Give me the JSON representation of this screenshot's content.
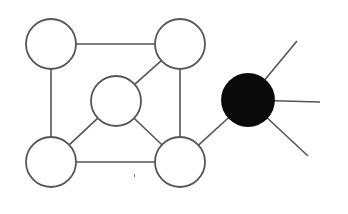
{
  "diagram": {
    "type": "graph",
    "background": "#ffffff",
    "stroke_color": "#555555",
    "node_fill": "#ffffff",
    "highlight_fill": "#0a0a0a",
    "nodes": [
      {
        "id": "n-top-left",
        "cx": 51,
        "cy": 44,
        "r": 25,
        "filled": false
      },
      {
        "id": "n-top-right",
        "cx": 180,
        "cy": 44,
        "r": 25,
        "filled": false
      },
      {
        "id": "n-center",
        "cx": 116,
        "cy": 101,
        "r": 25,
        "filled": false
      },
      {
        "id": "n-bottom-left",
        "cx": 51,
        "cy": 162,
        "r": 25,
        "filled": false
      },
      {
        "id": "n-bottom-right",
        "cx": 180,
        "cy": 162,
        "r": 25,
        "filled": false
      },
      {
        "id": "n-black",
        "cx": 248,
        "cy": 100,
        "r": 26,
        "filled": true
      }
    ],
    "edges": [
      {
        "from": "n-top-left",
        "to": "n-top-right"
      },
      {
        "from": "n-top-left",
        "to": "n-bottom-left"
      },
      {
        "from": "n-top-right",
        "to": "n-bottom-right"
      },
      {
        "from": "n-bottom-left",
        "to": "n-bottom-right"
      },
      {
        "from": "n-center",
        "to": "n-top-right"
      },
      {
        "from": "n-center",
        "to": "n-bottom-left"
      },
      {
        "from": "n-center",
        "to": "n-bottom-right"
      },
      {
        "from": "n-bottom-right",
        "to": "n-black"
      }
    ],
    "dangling_edges": [
      {
        "from": "n-black",
        "x2": 297,
        "y2": 41
      },
      {
        "from": "n-black",
        "x2": 320,
        "y2": 102
      },
      {
        "from": "n-black",
        "x2": 308,
        "y2": 156
      }
    ],
    "artifact_mark": {
      "x": 134,
      "y": 174
    }
  }
}
